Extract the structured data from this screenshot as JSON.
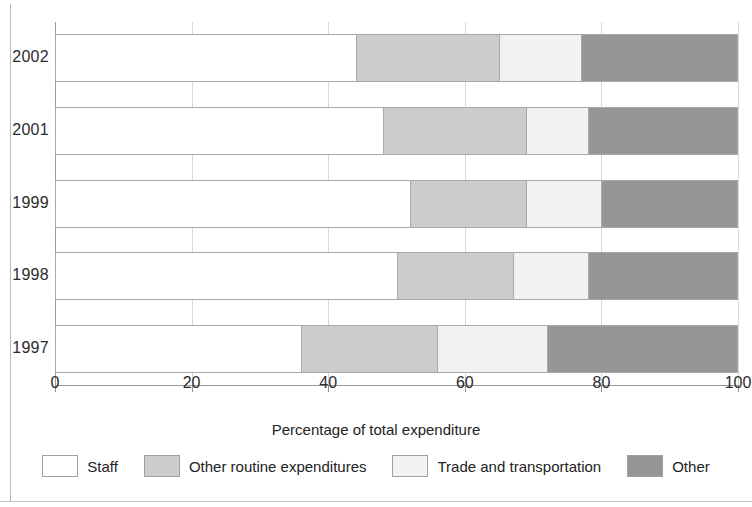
{
  "chart_data": {
    "type": "bar",
    "orientation": "horizontal",
    "stacked": true,
    "title": "",
    "xlabel": "Percentage of total expenditure",
    "ylabel": "",
    "xlim": [
      0,
      100
    ],
    "xticks": [
      0,
      20,
      40,
      60,
      80,
      100
    ],
    "xtick_labels": [
      "0",
      "20",
      "40",
      "60",
      "80",
      "100"
    ],
    "grid": true,
    "legend_position": "bottom",
    "categories": [
      "2002",
      "2001",
      "1999",
      "1998",
      "1997"
    ],
    "series": [
      {
        "name": "Staff",
        "color": "#ffffff",
        "values": [
          44,
          48,
          52,
          50,
          36
        ]
      },
      {
        "name": "Other routine expenditures",
        "color": "#cccccc",
        "values": [
          21,
          21,
          17,
          17,
          20
        ]
      },
      {
        "name": "Trade and transportation",
        "color": "#f2f2f2",
        "values": [
          12,
          9,
          11,
          11,
          16
        ]
      },
      {
        "name": "Other",
        "color": "#969696",
        "values": [
          23,
          22,
          20,
          22,
          28
        ]
      }
    ],
    "cumulative_boundaries": {
      "2002": [
        44,
        65,
        77,
        100
      ],
      "2001": [
        48,
        69,
        78,
        100
      ],
      "1999": [
        52,
        69,
        80,
        100
      ],
      "1998": [
        50,
        67,
        78,
        100
      ],
      "1997": [
        36,
        56,
        72,
        100
      ]
    }
  },
  "legend": {
    "items": [
      {
        "label": "Staff",
        "color": "#ffffff"
      },
      {
        "label": "Other routine expenditures",
        "color": "#cccccc"
      },
      {
        "label": "Trade and transportation",
        "color": "#f2f2f2"
      },
      {
        "label": "Other",
        "color": "#969696"
      }
    ]
  },
  "axis": {
    "x_title": "Percentage of total expenditure"
  }
}
